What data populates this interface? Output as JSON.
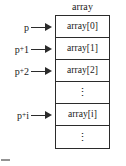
{
  "figure": {
    "title": "array",
    "type": "array-pointer-memory-layout",
    "cells": [
      {
        "label": "array[0]",
        "kind": "element"
      },
      {
        "label": "array[1]",
        "kind": "element"
      },
      {
        "label": "array[2]",
        "kind": "element"
      },
      {
        "label": "⋮",
        "kind": "ellipsis"
      },
      {
        "label": "array[i]",
        "kind": "element"
      },
      {
        "label": "⋮",
        "kind": "ellipsis"
      }
    ],
    "pointers": [
      {
        "base": "p",
        "offset": "",
        "full": "p",
        "target": "array[0]"
      },
      {
        "base": "p",
        "offset": "1",
        "full": "p+1",
        "target": "array[1]"
      },
      {
        "base": "p",
        "offset": "2",
        "full": "p+2",
        "target": "array[2]"
      },
      {
        "base": "p",
        "offset": "i",
        "full": "p+i",
        "target": "array[i]"
      }
    ],
    "plus_sign": "+",
    "caption_fragment": "",
    "colors": {
      "line": "#2b2b2b",
      "text": "#1a1a1a",
      "background": "#ffffff",
      "caption": "#8e8e8e"
    }
  }
}
